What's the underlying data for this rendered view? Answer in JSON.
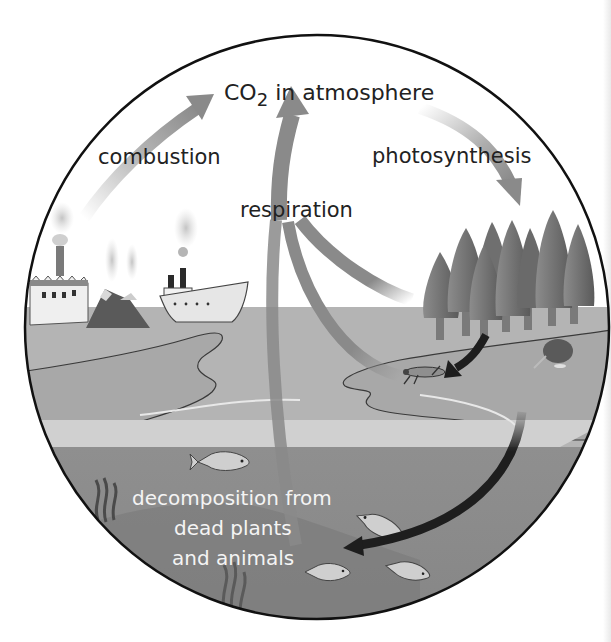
{
  "diagram": {
    "type": "carbon-cycle",
    "labels": {
      "atmosphere_prefix": "CO",
      "atmosphere_subscript": "2",
      "atmosphere_suffix": " in atmosphere",
      "combustion": "combustion",
      "photosynthesis": "photosynthesis",
      "respiration": "respiration",
      "decomposition_line1": "decomposition from",
      "decomposition_line2": "dead plants",
      "decomposition_line3": "and animals"
    },
    "scene_elements": [
      "factory",
      "volcanoes",
      "steamship",
      "forest",
      "grasshopper",
      "kiwi-bird",
      "fish",
      "seaweed"
    ],
    "colors": {
      "sky": "#ffffff",
      "land": "#b4b4b4",
      "beach": "#d0d0d0",
      "water": "#8e8e8e",
      "arrow_gray": "#8a8a8a",
      "arrow_dark": "#1e1e1e",
      "outline": "#111111"
    }
  }
}
